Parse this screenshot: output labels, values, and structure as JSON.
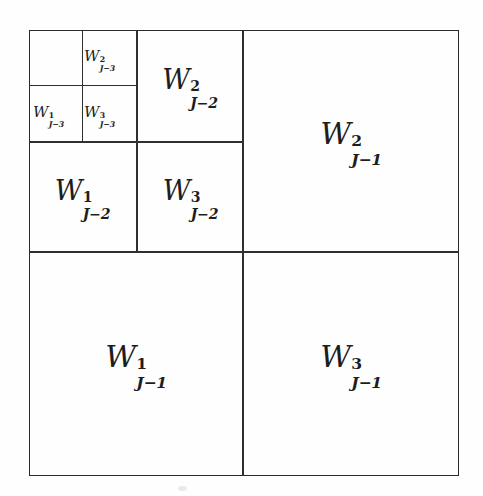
{
  "figure": {
    "background_color": "#fefefe",
    "line_color": "#2f2f2f",
    "text_color": "#1d1d1d"
  },
  "regions": [
    {
      "id": "W2-Jm3",
      "symbol": "W",
      "superscript": "2",
      "subscript": "J−3",
      "level": "J-3",
      "orientation": "2",
      "tier": "small",
      "quadrant": "top-right-of-level3"
    },
    {
      "id": "W1-Jm3",
      "symbol": "W",
      "superscript": "1",
      "subscript": "J−3",
      "level": "J-3",
      "orientation": "1",
      "tier": "small",
      "quadrant": "bottom-left-of-level3"
    },
    {
      "id": "W3-Jm3",
      "symbol": "W",
      "superscript": "3",
      "subscript": "J−3",
      "level": "J-3",
      "orientation": "3",
      "tier": "small",
      "quadrant": "bottom-right-of-level3"
    },
    {
      "id": "W2-Jm2",
      "symbol": "W",
      "superscript": "2",
      "subscript": "J−2",
      "level": "J-2",
      "orientation": "2",
      "tier": "mid",
      "quadrant": "top-right-of-level2"
    },
    {
      "id": "W1-Jm2",
      "symbol": "W",
      "superscript": "1",
      "subscript": "J−2",
      "level": "J-2",
      "orientation": "1",
      "tier": "mid",
      "quadrant": "bottom-left-of-level2"
    },
    {
      "id": "W3-Jm2",
      "symbol": "W",
      "superscript": "3",
      "subscript": "J−2",
      "level": "J-2",
      "orientation": "3",
      "tier": "mid",
      "quadrant": "bottom-right-of-level2"
    },
    {
      "id": "W2-Jm1",
      "symbol": "W",
      "superscript": "2",
      "subscript": "J−1",
      "level": "J-1",
      "orientation": "2",
      "tier": "large",
      "quadrant": "top-right"
    },
    {
      "id": "W1-Jm1",
      "symbol": "W",
      "superscript": "1",
      "subscript": "J−1",
      "level": "J-1",
      "orientation": "1",
      "tier": "large",
      "quadrant": "bottom-left"
    },
    {
      "id": "W3-Jm1",
      "symbol": "W",
      "superscript": "3",
      "subscript": "J−1",
      "level": "J-1",
      "orientation": "3",
      "tier": "large",
      "quadrant": "bottom-right"
    }
  ]
}
